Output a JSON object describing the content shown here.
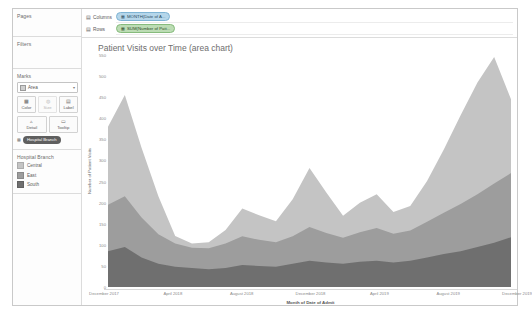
{
  "panel": {
    "pages_title": "Pages",
    "filters_title": "Filters",
    "marks_title": "Marks",
    "mark_type": "Area",
    "mark_type_caret": "▾",
    "shelves": [
      {
        "name": "color-shelf",
        "label": "Color",
        "icon": "color-icon",
        "glyph": "▩",
        "dim": false
      },
      {
        "name": "size-shelf",
        "label": "Size",
        "icon": "size-icon",
        "glyph": "◍",
        "dim": true
      },
      {
        "name": "label-shelf",
        "label": "Label",
        "icon": "label-icon",
        "glyph": "▤",
        "dim": false
      },
      {
        "name": "detail-shelf",
        "label": "Detail",
        "icon": "detail-icon",
        "glyph": "▵",
        "dim": false
      },
      {
        "name": "tooltip-shelf",
        "label": "Tooltip",
        "icon": "tooltip-icon",
        "glyph": "▭",
        "dim": false
      }
    ],
    "mark_pill": {
      "icon": "color-legend-icon",
      "label": "Hospital Branch"
    },
    "legend_title": "Hospital Branch",
    "legend_items": [
      {
        "label": "Central",
        "color": "#c4c4c4"
      },
      {
        "label": "East",
        "color": "#9d9d9d"
      },
      {
        "label": "South",
        "color": "#6f6f6f"
      }
    ]
  },
  "shelves": {
    "columns_label": "Columns",
    "columns_icon": "grid-icon",
    "columns_pill": "MONTH(Date of A...",
    "columns_pill_icon": "calendar-icon",
    "rows_label": "Rows",
    "rows_icon": "rows-icon",
    "rows_pill": "SUM(Number of Pati...",
    "rows_pill_icon": "measure-icon"
  },
  "chart_data": {
    "type": "area",
    "title": "Patient Visits over Time (area chart)",
    "xlabel": "Month of Date of Admit",
    "ylabel": "Number of Patient Visits",
    "ylim": [
      0,
      550
    ],
    "yticks": [
      0,
      50,
      100,
      150,
      200,
      250,
      300,
      350,
      400,
      450,
      500,
      550
    ],
    "grid": false,
    "legend_position": "left-panel",
    "stacked": true,
    "categories": [
      "December 2017",
      "January 2018",
      "February 2018",
      "March 2018",
      "April 2018",
      "May 2018",
      "June 2018",
      "July 2018",
      "August 2018",
      "September 2018",
      "October 2018",
      "November 2018",
      "December 2018",
      "January 2019",
      "February 2019",
      "March 2019",
      "April 2019",
      "May 2019",
      "June 2019",
      "July 2019",
      "August 2019",
      "September 2019",
      "October 2019",
      "November 2019",
      "December 2019"
    ],
    "xtick_labels": [
      "December 2017",
      "April 2018",
      "August 2018",
      "December 2018",
      "April 2019",
      "August 2019",
      "December 2019"
    ],
    "xtick_indices": [
      0,
      4,
      8,
      12,
      16,
      20,
      24
    ],
    "series": [
      {
        "name": "South",
        "color": "#6f6f6f",
        "values": [
          85,
          95,
          70,
          55,
          48,
          45,
          42,
          45,
          52,
          50,
          48,
          55,
          62,
          58,
          55,
          60,
          62,
          58,
          62,
          70,
          78,
          85,
          95,
          105,
          118
        ]
      },
      {
        "name": "East",
        "color": "#9d9d9d",
        "values": [
          110,
          120,
          95,
          70,
          55,
          48,
          50,
          58,
          68,
          62,
          58,
          65,
          80,
          70,
          62,
          70,
          78,
          68,
          72,
          85,
          98,
          112,
          125,
          140,
          152
        ]
      },
      {
        "name": "Central",
        "color": "#c4c4c4",
        "values": [
          185,
          240,
          165,
          90,
          18,
          10,
          14,
          32,
          66,
          58,
          50,
          88,
          140,
          96,
          52,
          70,
          80,
          52,
          58,
          96,
          150,
          210,
          265,
          300,
          175
        ]
      }
    ]
  }
}
